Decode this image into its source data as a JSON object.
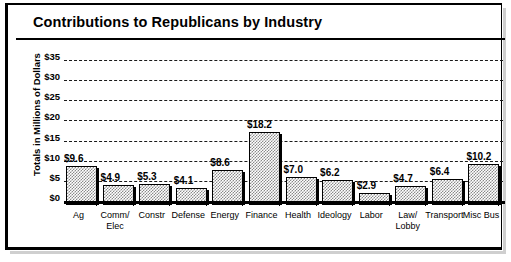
{
  "chart_data": {
    "type": "bar",
    "title": "Contributions to Republicans by Industry",
    "xlabel": "",
    "ylabel": "Totals in Millions of Dollars",
    "ylim": [
      0,
      35
    ],
    "ytick_step": 5,
    "grid": true,
    "legend": "none",
    "value_label_prefix": "$",
    "categories": [
      "Ag",
      "Comm/\nElec",
      "Constr",
      "Defense",
      "Energy",
      "Finance",
      "Health",
      "Ideology",
      "Labor",
      "Law/\nLobby",
      "Transport",
      "Misc Bus"
    ],
    "values": [
      9.6,
      4.9,
      5.3,
      4.1,
      8.6,
      18.2,
      7.0,
      6.2,
      2.9,
      4.7,
      6.4,
      10.2
    ],
    "value_labels": [
      "$9.6",
      "$4.9",
      "$5.3",
      "$4.1",
      "$8.6",
      "$18.2",
      "$7.0",
      "$6.2",
      "$2.9",
      "$4.7",
      "$6.4",
      "$10.2"
    ],
    "ytick_labels": [
      "$35",
      "$30",
      "$25",
      "$20",
      "$15",
      "$10",
      "$5",
      "$0"
    ],
    "ytick_values": [
      35,
      30,
      25,
      20,
      15,
      10,
      5,
      0
    ],
    "colors": {
      "bar_fill": "#8a8a8a",
      "bar_outline": "#000000",
      "background": "#ffffff",
      "text": "#000000",
      "gridline": "#1a1a1a",
      "frame": "#000000",
      "shadow": "#cfcfcf"
    }
  }
}
